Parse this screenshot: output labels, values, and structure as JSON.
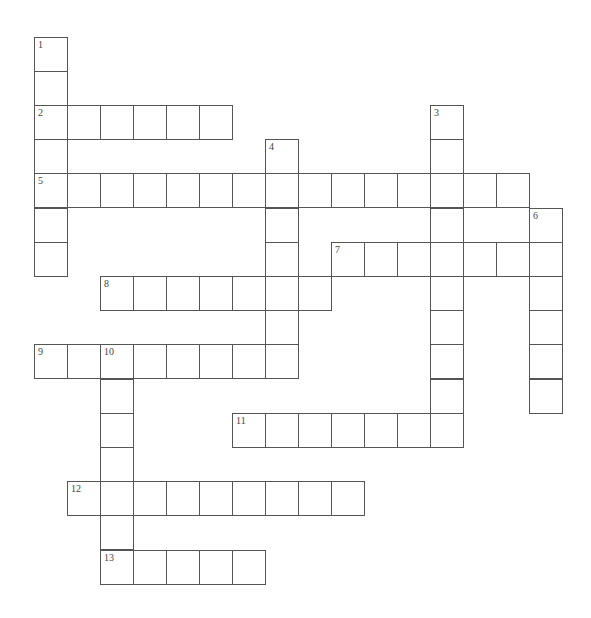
{
  "puzzle": {
    "type": "crossword",
    "grid": {
      "origin_x": 34,
      "origin_y": 36.5,
      "cell_w": 33,
      "cell_h": 34.2
    },
    "colors": {
      "border": "#555555",
      "cell_bg": "#ffffff",
      "number": "#444444"
    },
    "entries": [
      {
        "number": "1",
        "direction": "down",
        "row": 0,
        "col": 0,
        "length": 7
      },
      {
        "number": "2",
        "direction": "across",
        "row": 2,
        "col": 0,
        "length": 6
      },
      {
        "number": "3",
        "direction": "down",
        "row": 2,
        "col": 12,
        "length": 10
      },
      {
        "number": "4",
        "direction": "down",
        "row": 3,
        "col": 7,
        "length": 7
      },
      {
        "number": "5",
        "direction": "across",
        "row": 4,
        "col": 0,
        "length": 15
      },
      {
        "number": "6",
        "direction": "down",
        "row": 5,
        "col": 15,
        "length": 6
      },
      {
        "number": "7",
        "direction": "across",
        "row": 6,
        "col": 9,
        "length": 7
      },
      {
        "number": "8",
        "direction": "across",
        "row": 7,
        "col": 2,
        "length": 7
      },
      {
        "number": "9",
        "direction": "across",
        "row": 9,
        "col": 0,
        "length": 8
      },
      {
        "number": "10",
        "direction": "down",
        "row": 9,
        "col": 2,
        "length": 7
      },
      {
        "number": "11",
        "direction": "across",
        "row": 11,
        "col": 6,
        "length": 7
      },
      {
        "number": "12",
        "direction": "across",
        "row": 13,
        "col": 1,
        "length": 9
      },
      {
        "number": "13",
        "direction": "across",
        "row": 15,
        "col": 2,
        "length": 5
      }
    ]
  }
}
